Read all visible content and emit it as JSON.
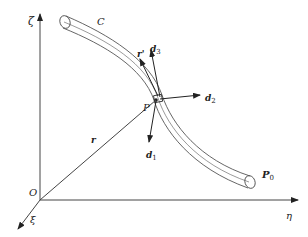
{
  "diagram": {
    "type": "rod centerline in global frame",
    "axes": {
      "vertical": "ζ",
      "horizontal": "η",
      "depth": "ξ",
      "origin": "O"
    },
    "curve_label": "C",
    "point_label": "P",
    "end_point": {
      "main": "P",
      "sub": "0"
    },
    "position_vector": "r",
    "tangent_vector": "r'",
    "directors": [
      {
        "main": "d",
        "sub": "1"
      },
      {
        "main": "d",
        "sub": "2"
      },
      {
        "main": "d",
        "sub": "3"
      }
    ],
    "colors": {
      "line": "#444444",
      "background": "#ffffff"
    }
  }
}
